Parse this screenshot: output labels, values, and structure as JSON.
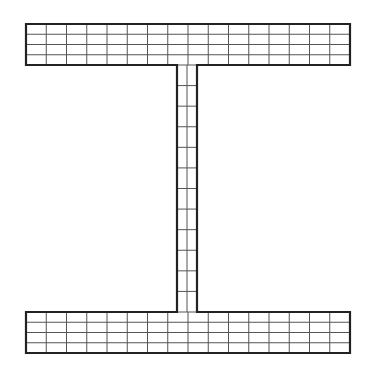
{
  "diagram": {
    "colors": {
      "background": "#ffffff",
      "outline": "#222222",
      "grid": "#555555"
    },
    "top_flange": {
      "columns": 16,
      "rows": 4
    },
    "web": {
      "columns": 2,
      "rows": 12
    },
    "bottom_flange": {
      "columns": 16,
      "rows": 4
    }
  }
}
